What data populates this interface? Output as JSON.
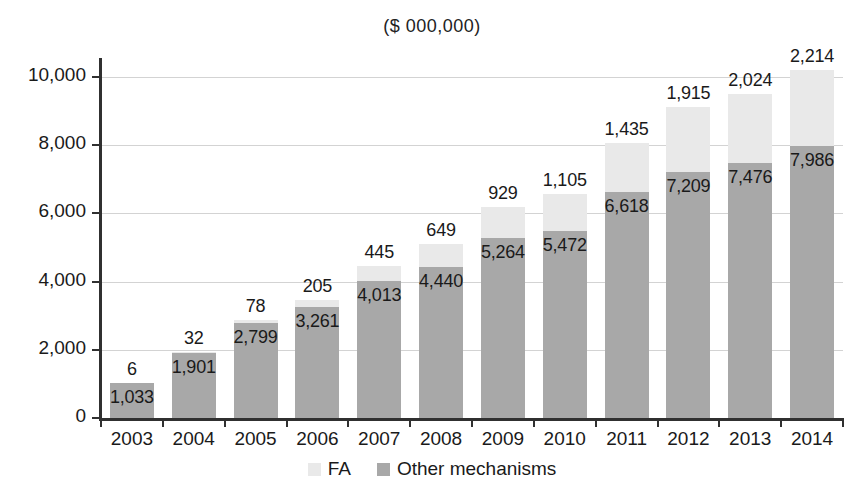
{
  "chart_data": {
    "type": "bar",
    "subtype": "stacked-bar",
    "title": "($ 000,000)",
    "xlabel": "",
    "ylabel": "",
    "ylim": [
      0,
      10000
    ],
    "yticks": [
      0,
      2000,
      4000,
      6000,
      8000,
      10000
    ],
    "ytick_labels": [
      "0",
      "2,000",
      "4,000",
      "6,000",
      "8,000",
      "10,000"
    ],
    "grid": true,
    "grid_axis": "y",
    "legend_position": "bottom",
    "categories": [
      "2003",
      "2004",
      "2005",
      "2006",
      "2007",
      "2008",
      "2009",
      "2010",
      "2011",
      "2012",
      "2013",
      "2014"
    ],
    "series": [
      {
        "name": "Other mechanisms",
        "color": "#a8a8a8",
        "values": [
          1033,
          1901,
          2799,
          3261,
          4013,
          4440,
          5264,
          5472,
          6618,
          7209,
          7476,
          7986
        ],
        "labels": [
          "1,033",
          "1,901",
          "2,799",
          "3,261",
          "4,013",
          "4,440",
          "5,264",
          "5,472",
          "6,618",
          "7,209",
          "7,476",
          "7,986"
        ]
      },
      {
        "name": "FA",
        "color": "#e9e9e9",
        "values": [
          6,
          32,
          78,
          205,
          445,
          649,
          929,
          1105,
          1435,
          1915,
          2024,
          2214
        ],
        "labels": [
          "6",
          "32",
          "78",
          "205",
          "445",
          "649",
          "929",
          "1,105",
          "1,435",
          "1,915",
          "2,024",
          "2,214"
        ]
      }
    ],
    "totals": [
      1039,
      1933,
      2877,
      3466,
      4458,
      5089,
      6193,
      6577,
      8053,
      9124,
      9500,
      10200
    ]
  },
  "legend": {
    "items": [
      {
        "label": "FA",
        "swatch": "#e9e9e9"
      },
      {
        "label": "Other mechanisms",
        "swatch": "#a8a8a8"
      }
    ]
  },
  "axis": {
    "y_tick_labels": [
      "10,000",
      "8,000",
      "6,000",
      "4,000",
      "2,000",
      "0"
    ],
    "x_tick_labels": [
      "2003",
      "2004",
      "2005",
      "2006",
      "2007",
      "2008",
      "2009",
      "2010",
      "2011",
      "2012",
      "2013",
      "2014"
    ]
  }
}
